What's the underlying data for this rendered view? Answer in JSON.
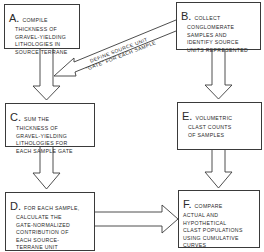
{
  "diagram": {
    "type": "flowchart",
    "boxes": [
      {
        "id": "A",
        "letter": "A.",
        "first": "COMPILE",
        "lines": [
          "THICKNESS OF",
          "GRAVEL-YIELDING",
          "LITHOLOGIES IN",
          "SOURCE TERRANE"
        ]
      },
      {
        "id": "B",
        "letter": "B.",
        "first": "COLLECT",
        "lines": [
          "CONGLOMERATE",
          "SAMPLES AND",
          "IDENTIFY SOURCE",
          "UNITS REPRESENTED"
        ]
      },
      {
        "id": "C",
        "letter": "C.",
        "first": "SUM THE",
        "lines": [
          "THICKNESS OF",
          "GRAVEL-YIELDING",
          "LITHOLOGIES FOR",
          "EACH SAMPLE GATE"
        ]
      },
      {
        "id": "E",
        "letter": "E.",
        "first": "VOLUMETRIC",
        "lines": [
          "CLAST COUNTS",
          "OF SAMPLES"
        ]
      },
      {
        "id": "D",
        "letter": "D.",
        "first": "FOR EACH SAMPLE,",
        "lines": [
          "CALCULATE THE",
          "GATE-NORMALIZED",
          "CONTRIBUTION OF",
          "EACH SOURCE-",
          "TERRANE UNIT"
        ]
      },
      {
        "id": "F",
        "letter": "F.",
        "first": "COMPARE",
        "lines": [
          "ACTUAL AND",
          "HYPOTHETICAL",
          "CLAST POPULATIONS",
          "USING CUMULATIVE",
          "CURVES"
        ]
      }
    ],
    "arrow_label": {
      "line1": "DEFINE SOURCE UNIT",
      "line2": "\"GATE\" FOR EACH SAMPLE"
    },
    "connections": [
      {
        "from": "A",
        "to": "C"
      },
      {
        "from": "B",
        "to": "C",
        "label": "DEFINE SOURCE UNIT \"GATE\" FOR EACH SAMPLE"
      },
      {
        "from": "B",
        "to": "E"
      },
      {
        "from": "C",
        "to": "D"
      },
      {
        "from": "E",
        "to": "F"
      },
      {
        "from": "D",
        "to": "F"
      }
    ]
  }
}
